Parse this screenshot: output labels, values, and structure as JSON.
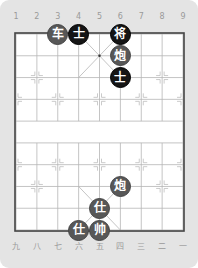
{
  "board": {
    "files": 9,
    "ranks": 10,
    "origin_x": 16,
    "origin_y": 34,
    "spacing_x": 20.875,
    "spacing_y": 21.78,
    "colors": {
      "panel_background": "#e4e4e4",
      "board_background": "#ffffff",
      "grid_line": "#b5b5b5",
      "border": "#444444",
      "red_piece": "#575757",
      "black_piece": "#151515",
      "label": "#9a9a9a"
    }
  },
  "top_labels": [
    "1",
    "2",
    "3",
    "4",
    "5",
    "6",
    "7",
    "8",
    "9"
  ],
  "bottom_labels": [
    "九",
    "八",
    "七",
    "六",
    "五",
    "四",
    "三",
    "二",
    "一"
  ],
  "pieces": [
    {
      "name": "chariot",
      "char": "车",
      "side": "red",
      "file": 2,
      "rank": 0
    },
    {
      "name": "advisor",
      "char": "士",
      "side": "black",
      "file": 3,
      "rank": 0
    },
    {
      "name": "general",
      "char": "将",
      "side": "black",
      "file": 5,
      "rank": 0
    },
    {
      "name": "cannon",
      "char": "炮",
      "side": "red",
      "file": 5,
      "rank": 1
    },
    {
      "name": "advisor",
      "char": "士",
      "side": "black",
      "file": 5,
      "rank": 2
    },
    {
      "name": "cannon",
      "char": "炮",
      "side": "red",
      "file": 5,
      "rank": 7
    },
    {
      "name": "advisor",
      "char": "仕",
      "side": "red",
      "file": 4,
      "rank": 8
    },
    {
      "name": "advisor",
      "char": "仕",
      "side": "red",
      "file": 3,
      "rank": 9
    },
    {
      "name": "king",
      "char": "帅",
      "side": "red",
      "file": 4,
      "rank": 9
    }
  ]
}
